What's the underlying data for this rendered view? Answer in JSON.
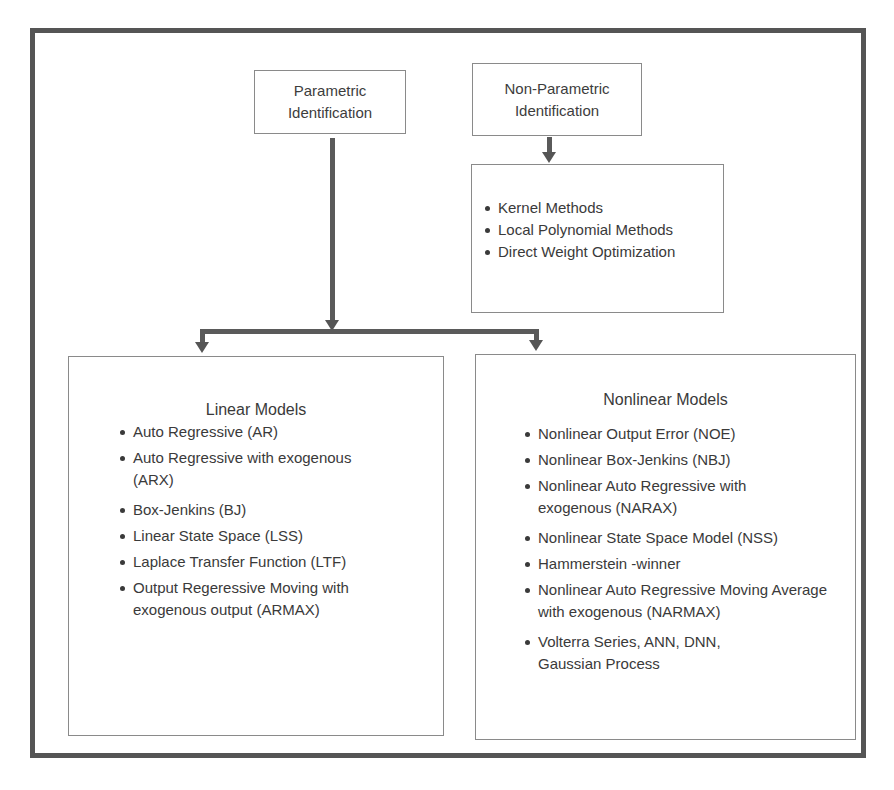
{
  "diagram": {
    "top_nodes": {
      "parametric": {
        "line1": "Parametric",
        "line2": "Identification"
      },
      "non_parametric": {
        "line1": "Non-Parametric",
        "line2": "Identification"
      }
    },
    "non_parametric_methods": {
      "items": [
        "Kernel Methods",
        "Local Polynomial Methods",
        "Direct Weight Optimization"
      ]
    },
    "linear_models": {
      "title": "Linear Models",
      "items": [
        "Auto Regressive (AR)",
        "Auto Regressive with exogenous (ARX)",
        "Box-Jenkins (BJ)",
        "Linear State Space (LSS)",
        "Laplace Transfer Function (LTF)",
        "Output Regeressive Moving with exogenous output (ARMAX)"
      ]
    },
    "nonlinear_models": {
      "title": "Nonlinear Models",
      "items": [
        "Nonlinear Output Error (NOE)",
        "Nonlinear Box-Jenkins (NBJ)",
        "Nonlinear Auto Regressive with exogenous (NARAX)",
        "Nonlinear State Space Model (NSS)",
        "Hammerstein -winner",
        "Nonlinear Auto Regressive Moving Average with exogenous (NARMAX)",
        "Volterra Series, ANN, DNN, Gaussian Process"
      ]
    },
    "colors": {
      "frame": "#555555",
      "connector": "#5a5a5a",
      "box_border": "#8a8a8a",
      "text": "#3a3a3a"
    }
  }
}
